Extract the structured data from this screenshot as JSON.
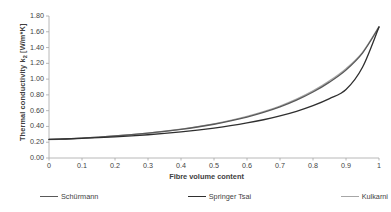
{
  "chart_data": {
    "type": "line",
    "title": "",
    "xlabel": "Fibre volume content",
    "ylabel": "Thermal conductivity k₂ [W/m*K]",
    "ylabel_main": "Thermal conductivity k",
    "ylabel_sub": "2",
    "ylabel_unit": " [W/m*K]",
    "xlim": [
      0,
      1
    ],
    "ylim": [
      0,
      1.8
    ],
    "xticks": [
      0,
      0.1,
      0.2,
      0.3,
      0.4,
      0.5,
      0.6,
      0.7,
      0.8,
      0.9,
      1
    ],
    "xtick_labels": [
      "0",
      "0.1",
      "0.2",
      "0.3",
      "0.4",
      "0.5",
      "0.6",
      "0.7",
      "0.8",
      "0.9",
      "1"
    ],
    "yticks": [
      0,
      0.2,
      0.4,
      0.6,
      0.8,
      1.0,
      1.2,
      1.4,
      1.6,
      1.8
    ],
    "ytick_labels": [
      "0.00",
      "0.20",
      "0.40",
      "0.60",
      "0.80",
      "1.00",
      "1.20",
      "1.40",
      "1.60",
      "1.80"
    ],
    "grid": false,
    "legend_position": "bottom",
    "x": [
      0,
      0.05,
      0.1,
      0.15,
      0.2,
      0.25,
      0.3,
      0.35,
      0.4,
      0.45,
      0.5,
      0.55,
      0.6,
      0.65,
      0.7,
      0.75,
      0.8,
      0.85,
      0.9,
      0.95,
      1
    ],
    "series": [
      {
        "name": "Schürmann",
        "color": "#595959",
        "width": 1.3,
        "values": [
          0.235,
          0.243,
          0.253,
          0.265,
          0.279,
          0.296,
          0.315,
          0.337,
          0.363,
          0.393,
          0.428,
          0.47,
          0.519,
          0.578,
          0.648,
          0.733,
          0.836,
          0.962,
          1.116,
          1.33,
          1.66
        ]
      },
      {
        "name": "Springer Tsai",
        "color": "#2f2f2f",
        "width": 1.3,
        "values": [
          0.235,
          0.241,
          0.249,
          0.258,
          0.269,
          0.281,
          0.295,
          0.312,
          0.331,
          0.353,
          0.379,
          0.409,
          0.444,
          0.485,
          0.534,
          0.592,
          0.663,
          0.752,
          0.868,
          1.15,
          1.66
        ]
      },
      {
        "name": "Kulkarni",
        "color": "#a6a6a6",
        "width": 1.3,
        "values": [
          0.232,
          0.241,
          0.252,
          0.264,
          0.279,
          0.296,
          0.316,
          0.339,
          0.366,
          0.397,
          0.433,
          0.476,
          0.527,
          0.587,
          0.659,
          0.746,
          0.851,
          0.979,
          1.133,
          1.34,
          1.665
        ]
      }
    ]
  },
  "legend": {
    "items": [
      {
        "label": "Schürmann",
        "color": "#595959"
      },
      {
        "label": "Springer Tsai",
        "color": "#2f2f2f"
      },
      {
        "label": "Kulkarni",
        "color": "#a6a6a6"
      }
    ]
  },
  "axes": {
    "line_color": "#a6a6a6",
    "tick_color": "#a6a6a6",
    "text_color": "#3f3f3f"
  }
}
